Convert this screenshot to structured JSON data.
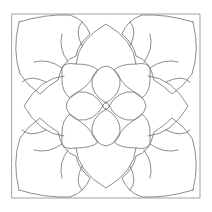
{
  "artwork": {
    "kind": "coloring-page-line-art",
    "subject": "symmetric flower mandala",
    "stroke_color": "#6e6e6e",
    "frame_color": "#8a8a8a",
    "background": "#ffffff",
    "symmetry": 4,
    "layers": [
      "frame",
      "outer-petals",
      "middle-petals",
      "inner-petals",
      "tendrils",
      "center"
    ]
  }
}
